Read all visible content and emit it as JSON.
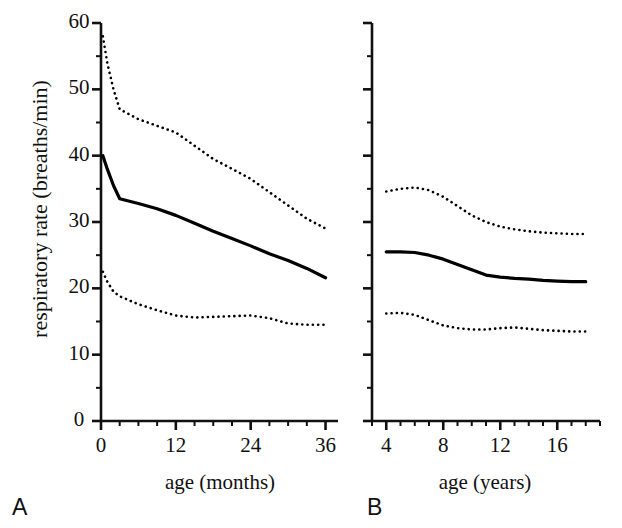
{
  "figure": {
    "ylabel": "respiratory rate (breaths/min)",
    "panelA_letter": "A",
    "panelB_letter": "B"
  },
  "chart_data": [
    {
      "type": "line",
      "panel": "A",
      "title": "",
      "xlabel": "age (months)",
      "ylabel": "respiratory rate (breaths/min)",
      "xlim": [
        0,
        38
      ],
      "ylim": [
        0,
        60
      ],
      "xticks": [
        0,
        12,
        24,
        36
      ],
      "xticklabels": [
        "0",
        "12",
        "24",
        "36"
      ],
      "xminor_step": 3,
      "yticks": [
        0,
        10,
        20,
        30,
        40,
        50,
        60
      ],
      "yticklabels": [
        "0",
        "10",
        "20",
        "30",
        "40",
        "50",
        "60"
      ],
      "yminor_step": 5,
      "grid": false,
      "legend": "none",
      "series": [
        {
          "name": "upper percentile",
          "style": "dotted",
          "x": [
            0.3,
            1,
            2,
            3,
            6,
            9,
            12,
            15,
            18,
            21,
            24,
            27,
            30,
            33,
            36
          ],
          "values": [
            58.0,
            54.0,
            50.0,
            47.0,
            45.5,
            44.5,
            43.5,
            41.5,
            39.5,
            38.0,
            36.5,
            34.5,
            32.5,
            30.5,
            29.0
          ]
        },
        {
          "name": "median",
          "style": "solid",
          "x": [
            0.3,
            1,
            2,
            3,
            6,
            9,
            12,
            15,
            18,
            21,
            24,
            27,
            30,
            33,
            36
          ],
          "values": [
            40.0,
            38.0,
            35.5,
            33.5,
            32.8,
            32.0,
            31.0,
            29.8,
            28.6,
            27.5,
            26.4,
            25.2,
            24.2,
            23.0,
            21.6
          ]
        },
        {
          "name": "lower percentile",
          "style": "dotted",
          "x": [
            0.3,
            1,
            2,
            3,
            6,
            9,
            12,
            15,
            18,
            21,
            24,
            27,
            30,
            33,
            36
          ],
          "values": [
            22.5,
            21.0,
            19.5,
            18.8,
            17.6,
            16.7,
            15.9,
            15.6,
            15.7,
            15.8,
            15.9,
            15.5,
            14.7,
            14.5,
            14.5
          ]
        }
      ]
    },
    {
      "type": "line",
      "panel": "B",
      "title": "",
      "xlabel": "age (years)",
      "ylabel": "respiratory rate (breaths/min)",
      "xlim": [
        3,
        19
      ],
      "ylim": [
        0,
        60
      ],
      "xticks": [
        4,
        8,
        12,
        16
      ],
      "xticklabels": [
        "4",
        "8",
        "12",
        "16"
      ],
      "xminor_step": 1,
      "yticks": [
        0,
        10,
        20,
        30,
        40,
        50,
        60
      ],
      "yticklabels": [
        "0",
        "10",
        "20",
        "30",
        "40",
        "50",
        "60"
      ],
      "yminor_step": 5,
      "grid": false,
      "legend": "none",
      "series": [
        {
          "name": "upper percentile",
          "style": "dotted",
          "x": [
            4,
            5,
            6,
            7,
            8,
            9,
            10,
            11,
            12,
            13,
            14,
            15,
            16,
            17,
            18
          ],
          "values": [
            34.6,
            35.0,
            35.2,
            34.8,
            33.8,
            32.4,
            31.0,
            30.0,
            29.3,
            28.9,
            28.6,
            28.4,
            28.3,
            28.2,
            28.2
          ]
        },
        {
          "name": "median",
          "style": "solid",
          "x": [
            4,
            5,
            6,
            7,
            8,
            9,
            10,
            11,
            12,
            13,
            14,
            15,
            16,
            17,
            18
          ],
          "values": [
            25.5,
            25.5,
            25.4,
            25.0,
            24.4,
            23.6,
            22.8,
            22.0,
            21.7,
            21.5,
            21.4,
            21.2,
            21.1,
            21.0,
            21.0
          ]
        },
        {
          "name": "lower percentile",
          "style": "dotted",
          "x": [
            4,
            5,
            6,
            7,
            8,
            9,
            10,
            11,
            12,
            13,
            14,
            15,
            16,
            17,
            18
          ],
          "values": [
            16.2,
            16.3,
            16.0,
            15.2,
            14.4,
            14.0,
            13.8,
            13.8,
            14.0,
            14.1,
            13.9,
            13.7,
            13.6,
            13.5,
            13.5
          ]
        }
      ]
    }
  ],
  "axes": {
    "panelA": {
      "xlabel": "age (months)",
      "xticklabels": [
        "0",
        "12",
        "24",
        "36"
      ],
      "yticklabels": [
        "0",
        "10",
        "20",
        "30",
        "40",
        "50",
        "60"
      ]
    },
    "panelB": {
      "xlabel": "age (years)",
      "xticklabels": [
        "4",
        "8",
        "12",
        "16"
      ]
    }
  },
  "colors": {
    "axis": "#111111",
    "line": "#000000",
    "background": "#ffffff"
  }
}
